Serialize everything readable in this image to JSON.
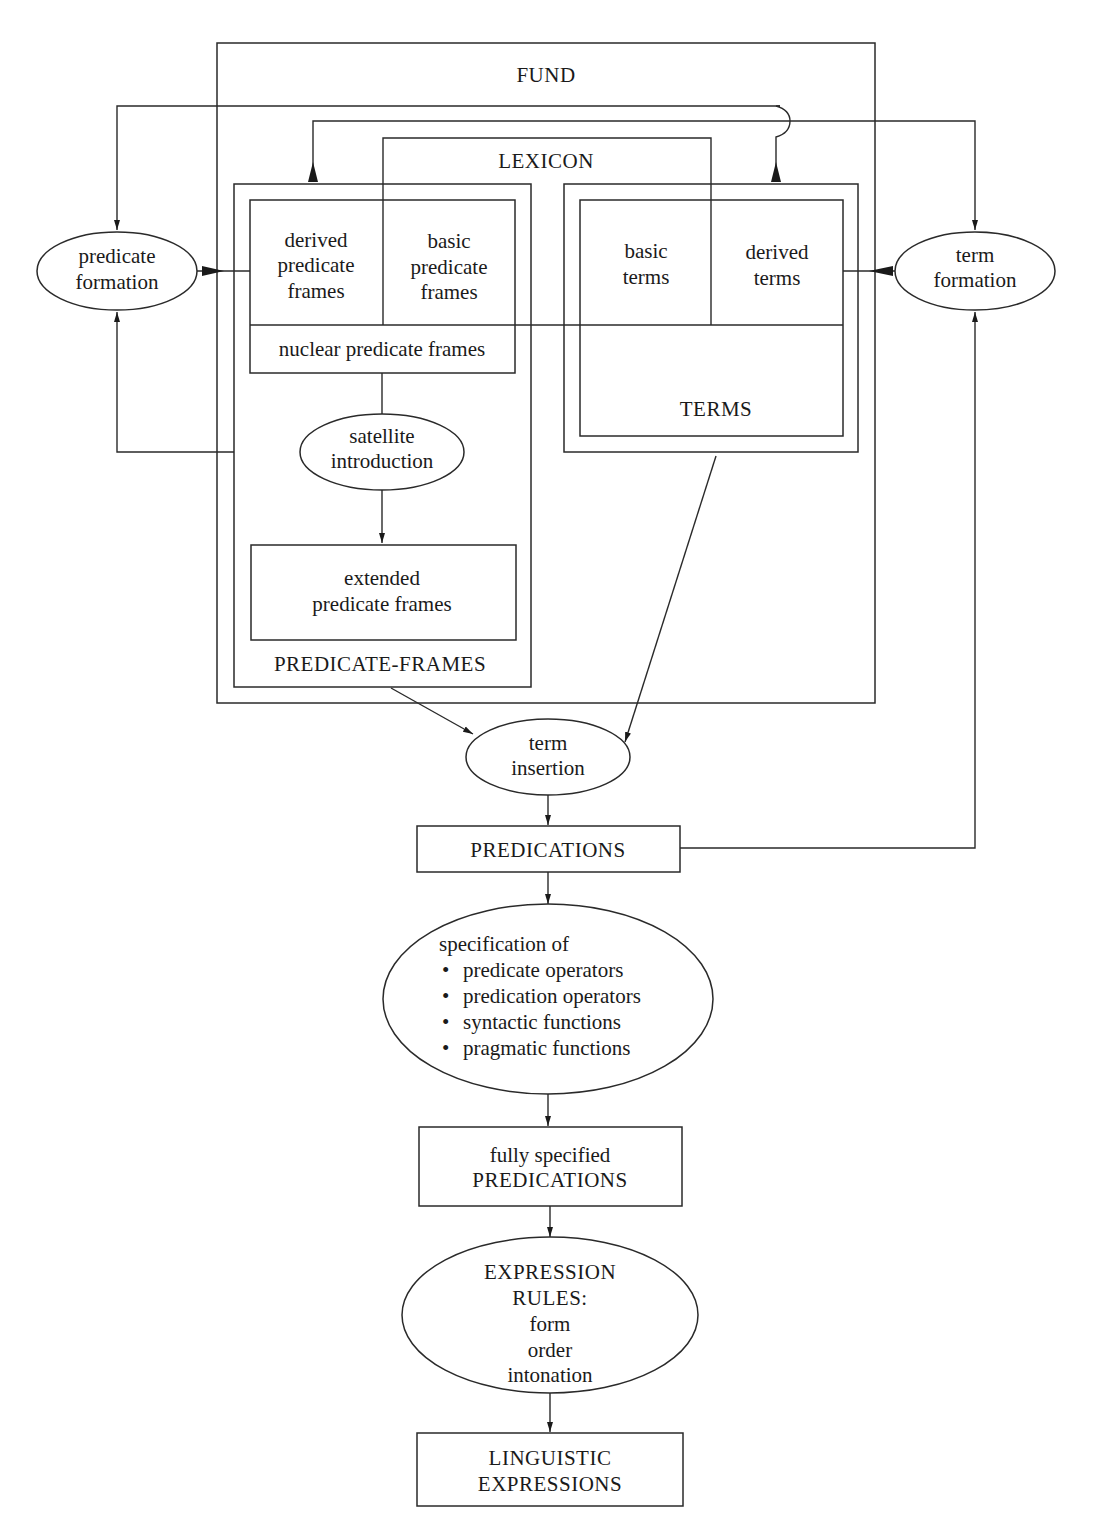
{
  "diagram": {
    "containers": {
      "fund": {
        "label": "FUND"
      },
      "lexicon": {
        "label": "LEXICON"
      },
      "predicate_frames": {
        "label": "PREDICATE-FRAMES"
      },
      "terms": {
        "label": "TERMS"
      }
    },
    "boxes": {
      "derived_predicate_frames": {
        "lines": [
          "derived",
          "predicate",
          "frames"
        ]
      },
      "basic_predicate_frames": {
        "lines": [
          "basic",
          "predicate",
          "frames"
        ]
      },
      "nuclear_predicate_frames": {
        "label": "nuclear predicate frames"
      },
      "extended_predicate_frames": {
        "lines": [
          "extended",
          "predicate frames"
        ]
      },
      "basic_terms": {
        "lines": [
          "basic",
          "terms"
        ]
      },
      "derived_terms": {
        "lines": [
          "derived",
          "terms"
        ]
      },
      "predications": {
        "label": "PREDICATIONS"
      },
      "fully_specified_predications": {
        "lines": [
          "fully specified",
          "PREDICATIONS"
        ]
      },
      "linguistic_expressions": {
        "lines": [
          "LINGUISTIC",
          "EXPRESSIONS"
        ]
      }
    },
    "processes": {
      "predicate_formation": {
        "lines": [
          "predicate",
          "formation"
        ]
      },
      "term_formation": {
        "lines": [
          "term",
          "formation"
        ]
      },
      "satellite_introduction": {
        "lines": [
          "satellite",
          "introduction"
        ]
      },
      "term_insertion": {
        "lines": [
          "term",
          "insertion"
        ]
      },
      "specification": {
        "heading": "specification of",
        "bullet": "•",
        "items": [
          "predicate operators",
          "predication operators",
          "syntactic functions",
          "pragmatic functions"
        ]
      },
      "expression_rules": {
        "lines": [
          "EXPRESSION",
          "RULES:",
          "form",
          "order",
          "intonation"
        ]
      }
    },
    "colors": {
      "line": "#2a2a2a",
      "text": "#1a1a1a",
      "background": "#ffffff"
    }
  }
}
